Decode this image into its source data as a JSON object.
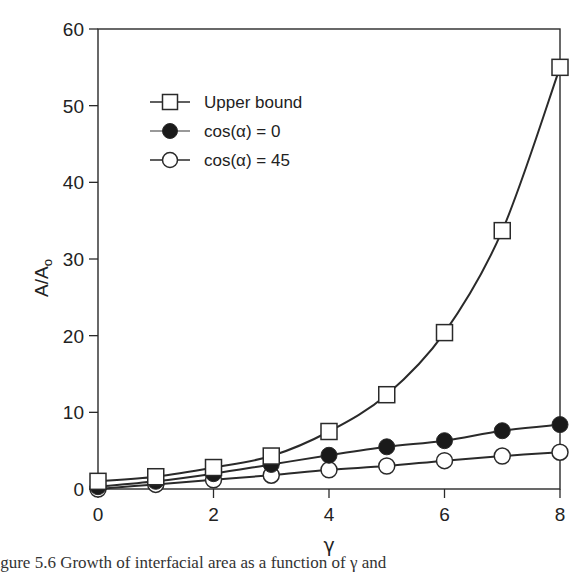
{
  "chart_data": {
    "type": "line",
    "title": "",
    "xlabel": "γ",
    "ylabel": "A/Ao",
    "ylabel_main": "A/A",
    "ylabel_sub": "o",
    "x": [
      0,
      1,
      2,
      3,
      4,
      5,
      6,
      7,
      8
    ],
    "xlim": [
      0,
      8
    ],
    "ylim": [
      0,
      60
    ],
    "xticks": [
      0,
      2,
      4,
      6,
      8
    ],
    "yticks": [
      0,
      10,
      20,
      30,
      40,
      50,
      60
    ],
    "grid": false,
    "legend_position": "upper-left-inside",
    "series": [
      {
        "name": "Upper bound",
        "marker": "open-square",
        "values": [
          1.0,
          1.6,
          2.8,
          4.3,
          7.5,
          12.3,
          20.4,
          33.7,
          55.0
        ]
      },
      {
        "name": "cos(α) = 0",
        "marker": "filled-circle",
        "values": [
          0.3,
          1.0,
          2.0,
          3.2,
          4.4,
          5.5,
          6.3,
          7.6,
          8.4
        ]
      },
      {
        "name": "cos(α) = 45",
        "marker": "open-circle",
        "values": [
          0.0,
          0.6,
          1.2,
          1.8,
          2.5,
          3.0,
          3.7,
          4.3,
          4.8
        ]
      }
    ]
  },
  "caption": "Figure 5.6     Growth of interfacial area as a function of γ and"
}
